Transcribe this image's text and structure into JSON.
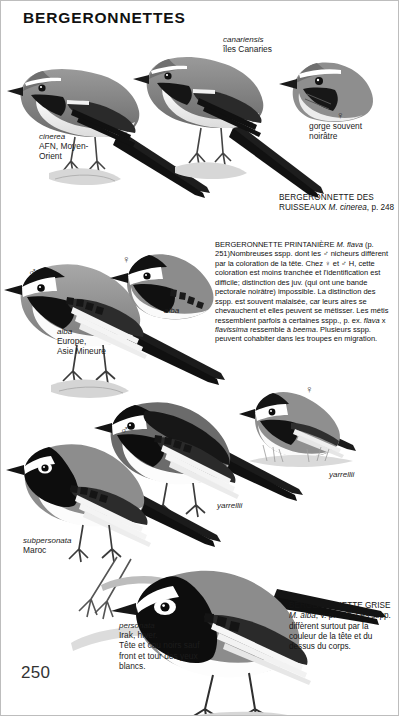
{
  "page": {
    "title": "BERGERONNETTES",
    "number": "250"
  },
  "symbols": {
    "male": "♂",
    "female": "♀"
  },
  "plate_groups": [
    {
      "id": "grey-wagtail",
      "labels": [
        {
          "name": "label-cinerea",
          "sci": "cinerea",
          "text": "AFN, Moyen-\nOrient"
        },
        {
          "name": "label-canariensis",
          "sci": "canariensis",
          "text": "îles Canaries"
        },
        {
          "name": "label-gorge-souvent-noiratre",
          "sci": "",
          "text": "gorge souvent\nnoirâtre"
        }
      ],
      "caption": {
        "name": "caption-bergeronnette-des-ruisseaux",
        "head": "BERGERONNETTE DES",
        "line2_pre": "RUISSEAUX ",
        "line2_sci": "M. cinerea",
        "line2_post": ", p. 248"
      }
    },
    {
      "id": "yellow-wagtail",
      "labels": [
        {
          "name": "label-alba-europe",
          "sci": "alba",
          "text": "Europe,\nAsie Mineure"
        },
        {
          "name": "label-alba-female",
          "sci": "alba",
          "text": ""
        }
      ]
    },
    {
      "id": "pied-wagtail",
      "labels": [
        {
          "name": "label-yarrellii-right",
          "sci": "yarrellii",
          "text": ""
        },
        {
          "name": "label-yarrellii-centre",
          "sci": "yarrellii",
          "text": ""
        },
        {
          "name": "label-subpersonata",
          "sci": "subpersonata",
          "text": "Maroc"
        }
      ]
    },
    {
      "id": "masked-wagtail",
      "labels": [
        {
          "name": "label-personata",
          "sci": "personata",
          "text": "Irak, hiver.\nTête et cou noirs sauf\nfront et tour des yeux\nblancs."
        }
      ],
      "caption": {
        "name": "caption-bergeronnette-grise",
        "head_pre": "BERGERONNETTE GRISE ",
        "head_sci": "M. alba",
        "head_post": ",",
        "body": "v. p. 248. Les sspp. diffèrent surtout par la couleur de la tête et du dessus du corps."
      }
    }
  ],
  "main_text": {
    "name": "text-bergeronnette-printaniere",
    "title_pre": "BERGERONNETTE PRINTANIÈRE ",
    "title_sci": "M. flava",
    "title_post": " (p. 251)",
    "paragraph_1": "Nombreuses sspp. dont les ♂ nicheurs diffèrent par la coloration de la tête. Chez ♀ et ♂ H, cette coloration est moins tranchée et l'identification est difficile; distinction des juv. (qui ont une bande pectorale noirâtre) impossible. La distinction des sspp. est souvent malaisée, car leurs aires se chevauchent et elles peuvent se métisser. Les métis ressemblent parfois à certaines sspp., p. ex. ",
    "inline_sci_1": "flava",
    "paragraph_1b": " x ",
    "inline_sci_2": "flavissima",
    "paragraph_1c": " ressemble à ",
    "inline_sci_3": "beema",
    "paragraph_1d": ". Plusieurs sspp. peuvent cohabiter dans les troupes en migration."
  },
  "colors": {
    "ink": "#141414",
    "paper": "#ffffff",
    "plumage_dark": "#1a1a1a",
    "plumage_mid": "#6e6e6e",
    "plumage_light": "#d8d8d8",
    "wash": "#cfcfcf"
  }
}
